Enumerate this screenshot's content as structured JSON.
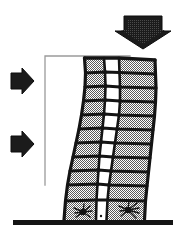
{
  "figure": {
    "title": "Seismic drift / soft-storey collapse mechanism diagram",
    "background_color": "#ffffff",
    "ink_color": "#141414",
    "hatch_fill_color": "#b0b0b0",
    "reference_line_color": "#9a9a9a",
    "ground_color": "#141414"
  },
  "loads": {
    "vertical": {
      "name": "vertical-load-arrow",
      "label": "",
      "direction": "down",
      "count": 1,
      "x": 120,
      "y": 16,
      "width": 46,
      "height": 32
    },
    "lateral": {
      "name": "lateral-load-arrows",
      "label": "",
      "direction": "right",
      "count": 2,
      "arrows": [
        {
          "x": 10,
          "y": 68,
          "width": 24,
          "height": 26
        },
        {
          "x": 10,
          "y": 131,
          "width": 24,
          "height": 26
        }
      ]
    }
  },
  "building": {
    "name": "leaning-frame-building",
    "storeys": 11,
    "bays": 3,
    "lean_direction": "right",
    "middle_bay_fill": "white",
    "outer_bay_fill": "hatched-gray",
    "top_y": 57,
    "base_y": 220,
    "base_left_x": 63,
    "base_right_x": 140,
    "top_left_x": 83,
    "top_right_x": 158
  },
  "reference_line": {
    "name": "plumb-reference-line",
    "label": "",
    "vertical_x": 45,
    "top_y": 56,
    "bottom_y": 185,
    "horizontal_to_x": 130
  },
  "ground": {
    "name": "ground-line",
    "label": "",
    "y": 222,
    "x1": 13,
    "x2": 173,
    "thickness": 5
  },
  "damage_marks": {
    "name": "base-damage-bursts",
    "label": "",
    "count": 2,
    "marks": [
      {
        "x": 80,
        "y": 211,
        "side": "left-column"
      },
      {
        "x": 128,
        "y": 209,
        "side": "right-column"
      }
    ]
  }
}
